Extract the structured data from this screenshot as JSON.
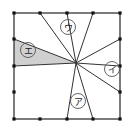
{
  "figure": {
    "canvas": {
      "width": 134,
      "height": 135
    },
    "colors": {
      "background": "#ffffff",
      "stroke": "#333333",
      "square_border": "#444444",
      "shaded_fill": "#d0d0d0",
      "dot": "#111111",
      "label_text": "#1a1a1a",
      "label_circle": "#555555"
    },
    "square": {
      "left": 14,
      "top": 13,
      "right": 120,
      "bottom": 119,
      "side_px": 106,
      "divisions": 4,
      "border_width": 1.4
    },
    "center_point": {
      "x": 76,
      "y": 63
    },
    "edge_dots": [
      {
        "x": 14,
        "y": 13
      },
      {
        "x": 40,
        "y": 13
      },
      {
        "x": 67,
        "y": 13
      },
      {
        "x": 93,
        "y": 13
      },
      {
        "x": 120,
        "y": 13
      },
      {
        "x": 120,
        "y": 39
      },
      {
        "x": 120,
        "y": 66
      },
      {
        "x": 120,
        "y": 92
      },
      {
        "x": 120,
        "y": 119
      },
      {
        "x": 93,
        "y": 119
      },
      {
        "x": 67,
        "y": 119
      },
      {
        "x": 40,
        "y": 119
      },
      {
        "x": 14,
        "y": 119
      },
      {
        "x": 14,
        "y": 92
      },
      {
        "x": 14,
        "y": 66
      },
      {
        "x": 14,
        "y": 39
      }
    ],
    "dot_radius": 1.6,
    "rays": [
      {
        "name": "ray-to-top-left-quarter",
        "to": {
          "x": 40,
          "y": 13
        }
      },
      {
        "name": "ray-to-top-mid",
        "to": {
          "x": 67,
          "y": 13
        }
      },
      {
        "name": "ray-to-top-right-quarter",
        "to": {
          "x": 93,
          "y": 13
        }
      },
      {
        "name": "ray-to-right-upper",
        "to": {
          "x": 120,
          "y": 39
        }
      },
      {
        "name": "ray-to-right-mid",
        "to": {
          "x": 120,
          "y": 66
        }
      },
      {
        "name": "ray-to-right-lower",
        "to": {
          "x": 120,
          "y": 92
        }
      },
      {
        "name": "ray-to-bottom-right-quarter",
        "to": {
          "x": 93,
          "y": 119
        }
      },
      {
        "name": "ray-to-bottom-mid",
        "to": {
          "x": 67,
          "y": 119
        }
      },
      {
        "name": "ray-to-left-mid",
        "to": {
          "x": 14,
          "y": 66
        }
      },
      {
        "name": "ray-to-left-upper",
        "to": {
          "x": 14,
          "y": 39
        }
      }
    ],
    "shaded_region": {
      "name": "triangle-e",
      "points": "76,63 14,39 14,66",
      "fill": "#d0d0d0"
    },
    "labels": [
      {
        "id": "label-a",
        "text": "ア",
        "x": 78,
        "y": 101,
        "circle_r": 7.5,
        "region": "bottom triangle"
      },
      {
        "id": "label-i",
        "text": "イ",
        "x": 112,
        "y": 69,
        "circle_r": 7.5,
        "region": "right triangle"
      },
      {
        "id": "label-u",
        "text": "ウ",
        "x": 68,
        "y": 27,
        "circle_r": 7.5,
        "region": "upper triangle"
      },
      {
        "id": "label-e",
        "text": "エ",
        "x": 28,
        "y": 50,
        "circle_r": 7.5,
        "region": "left shaded triangle"
      }
    ]
  }
}
